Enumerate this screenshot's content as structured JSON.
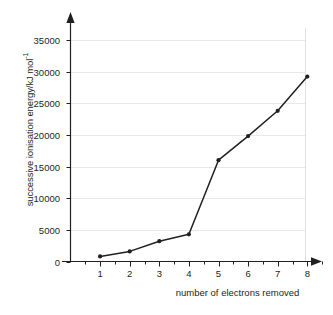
{
  "chart_data": {
    "type": "line",
    "title": "",
    "xlabel": "number of electrons removed",
    "ylabel": "successive ionisation energy/kJ mol",
    "ylabel_sup": "-1",
    "x": [
      1,
      2,
      3,
      4,
      5,
      6,
      7,
      8
    ],
    "categories": [
      "1",
      "2",
      "3",
      "4",
      "5",
      "6",
      "7",
      "8"
    ],
    "values": [
      800,
      1600,
      3200,
      4300,
      16000,
      19800,
      23800,
      29200
    ],
    "series": [
      {
        "name": "successive ionisation energy",
        "values": [
          800,
          1600,
          3200,
          4300,
          16000,
          19800,
          23800,
          29200
        ]
      }
    ],
    "xlim": [
      0.5,
      8.6
    ],
    "ylim": [
      0,
      37500
    ],
    "ytick_labels": [
      "0",
      "5000",
      "10000",
      "15000",
      "20000",
      "25000",
      "30000",
      "35000"
    ],
    "ytick_values": [
      0,
      5000,
      10000,
      15000,
      20000,
      25000,
      30000,
      35000
    ],
    "xtick_labels": [
      "1",
      "2",
      "3",
      "4",
      "5",
      "6",
      "7",
      "8"
    ],
    "xtick_values": [
      1,
      2,
      3,
      4,
      5,
      6,
      7,
      8
    ],
    "grid": "horizontal",
    "legend": "none",
    "marker": "filled-circle",
    "line_color": "#231f20",
    "grid_color": "#e9e9e9",
    "axis_color": "#231f20",
    "background": "#ffffff"
  }
}
